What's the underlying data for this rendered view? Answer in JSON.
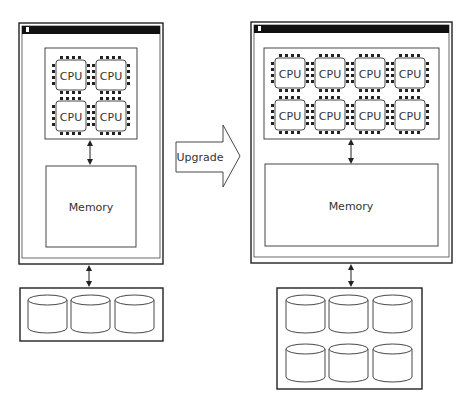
{
  "diagram": {
    "before": {
      "cpu_label": "CPU",
      "cpu_count": 4,
      "memory_label": "Memory",
      "disk_count": 3
    },
    "upgrade_arrow": {
      "label": "Upgrade"
    },
    "after": {
      "cpu_label": "CPU",
      "cpu_count": 8,
      "memory_label": "Memory",
      "disk_count": 6
    },
    "colors": {
      "stroke": "#222222",
      "title_bar": "#111111",
      "background": "#ffffff"
    }
  }
}
